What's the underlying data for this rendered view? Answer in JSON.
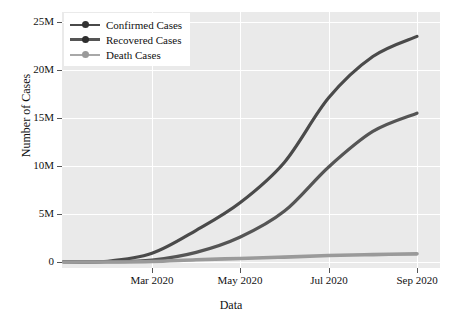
{
  "chart_data": {
    "type": "line",
    "title": "",
    "xlabel": "Data",
    "ylabel": "Number of Cases",
    "grid": true,
    "legend_position": "upper left",
    "x_tick_labels": [
      "Mar 2020",
      "May 2020",
      "Jul 2020",
      "Sep 2020"
    ],
    "x_tick_positions": [
      152,
      240,
      329,
      417
    ],
    "y_tick_labels": [
      "0",
      "5M",
      "10M",
      "15M",
      "20M",
      "25M"
    ],
    "y_tick_values": [
      0,
      5000000,
      10000000,
      15000000,
      20000000,
      25000000
    ],
    "ylim": [
      0,
      26000000
    ],
    "xlim": [
      "2020-01-22",
      "2020-09-20"
    ],
    "x": [
      "Jan 2020",
      "Feb 2020",
      "Mar 2020",
      "Apr 2020",
      "May 2020",
      "Jun 2020",
      "Jul 2020",
      "Aug 2020",
      "Sep 2020"
    ],
    "series": [
      {
        "name": "Confirmed Cases",
        "color": "#4a4a4a",
        "values": [
          0.05,
          0.08,
          0.9,
          3.3,
          6.2,
          10.4,
          17.1,
          21.4,
          23.5
        ],
        "units": "millions"
      },
      {
        "name": "Recovered Cases",
        "color": "#555555",
        "values": [
          0.01,
          0.03,
          0.2,
          1.0,
          2.6,
          5.3,
          9.9,
          13.6,
          15.5
        ],
        "units": "millions"
      },
      {
        "name": "Death Cases",
        "color": "#9a9a9a",
        "values": [
          0.0,
          0.0,
          0.05,
          0.23,
          0.37,
          0.51,
          0.67,
          0.77,
          0.85
        ],
        "units": "millions"
      }
    ]
  },
  "legend": {
    "items": [
      {
        "label": "Confirmed Cases",
        "color": "#4a4a4a"
      },
      {
        "label": "Recovered Cases",
        "color": "#555555"
      },
      {
        "label": "Death Cases",
        "color": "#9a9a9a"
      }
    ]
  },
  "axes": {
    "x_label": "Data",
    "y_label": "Number of Cases"
  },
  "style": {
    "plot_background": "#eaeaea",
    "grid_color": "#ffffff",
    "figure_background": "#ffffff",
    "text_color": "#111111"
  }
}
